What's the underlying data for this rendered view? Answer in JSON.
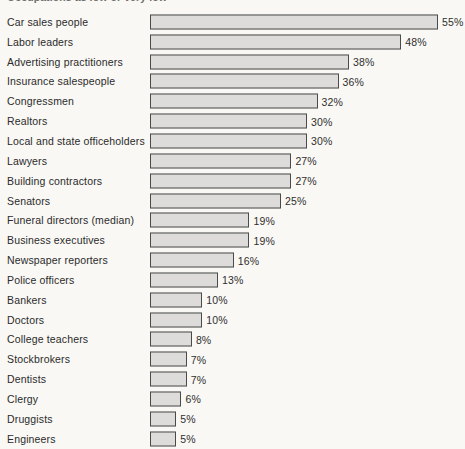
{
  "chart_data": {
    "type": "bar",
    "orientation": "horizontal",
    "title": "Occupations as low or very low",
    "xlabel": "",
    "ylabel": "",
    "xlim": [
      0,
      55
    ],
    "grid": false,
    "legend": null,
    "value_suffix": "%",
    "categories": [
      "Car sales people",
      "Labor leaders",
      "Advertising practitioners",
      "Insurance salespeople",
      "Congressmen",
      "Realtors",
      "Local and state officeholders",
      "Lawyers",
      "Building contractors",
      "Senators",
      "Funeral directors (median)",
      "Business executives",
      "Newspaper reporters",
      "Police officers",
      "Bankers",
      "Doctors",
      "College teachers",
      "Stockbrokers",
      "Dentists",
      "Clergy",
      "Druggists",
      "Engineers"
    ],
    "values": [
      55,
      48,
      38,
      36,
      32,
      30,
      30,
      27,
      27,
      25,
      19,
      19,
      16,
      13,
      10,
      10,
      8,
      7,
      7,
      6,
      5,
      5
    ],
    "value_labels": [
      "55%",
      "48%",
      "38%",
      "36%",
      "32%",
      "30%",
      "30%",
      "27%",
      "27%",
      "25%",
      "19%",
      "19%",
      "16%",
      "13%",
      "10%",
      "10%",
      "8%",
      "7%",
      "7%",
      "6%",
      "5%",
      "5%"
    ],
    "colors": {
      "bar_fill": "#dddcda",
      "bar_border": "#4a4a4a",
      "background": "#f9f8f4",
      "label_text": "#2b2b2b"
    }
  }
}
